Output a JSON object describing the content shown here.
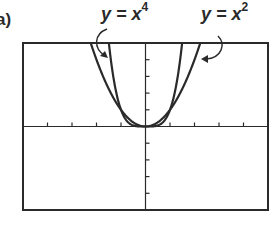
{
  "figure": {
    "part_label": "a)"
  },
  "chart_data": {
    "type": "line",
    "title": "",
    "xlabel": "",
    "ylabel": "",
    "xlim": [
      -5,
      5
    ],
    "ylim": [
      -5,
      5
    ],
    "xticks": [
      -5,
      -4,
      -3,
      -2,
      -1,
      0,
      1,
      2,
      3,
      4,
      5
    ],
    "yticks": [
      -5,
      -4,
      -3,
      -2,
      -1,
      0,
      1,
      2,
      3,
      4,
      5
    ],
    "tick_labels_shown": false,
    "grid": false,
    "series": [
      {
        "name": "y = x^4",
        "label_base": "y = x",
        "label_exp": "4",
        "function": "x^4",
        "x": [
          -1.495,
          -1.25,
          -1.0,
          -0.75,
          -0.5,
          -0.25,
          0,
          0.25,
          0.5,
          0.75,
          1.0,
          1.25,
          1.495
        ],
        "values": [
          5.0,
          2.44,
          1.0,
          0.316,
          0.0625,
          0.0039,
          0,
          0.0039,
          0.0625,
          0.316,
          1.0,
          2.44,
          5.0
        ]
      },
      {
        "name": "y = x^2",
        "label_base": "y = x",
        "label_exp": "2",
        "function": "x^2",
        "x": [
          -2.236,
          -2.0,
          -1.5,
          -1.0,
          -0.5,
          0,
          0.5,
          1.0,
          1.5,
          2.0,
          2.236
        ],
        "values": [
          5.0,
          4.0,
          2.25,
          1.0,
          0.25,
          0,
          0.25,
          1.0,
          2.25,
          4.0,
          5.0
        ]
      }
    ],
    "annotations": [
      {
        "text": "y = x^4",
        "points_to": "y = x^4",
        "position": "top-left"
      },
      {
        "text": "y = x^2",
        "points_to": "y = x^2",
        "position": "top-right"
      }
    ],
    "legend": "none"
  },
  "style": {
    "ink": "#2a2a2a",
    "background": "#ffffff"
  }
}
